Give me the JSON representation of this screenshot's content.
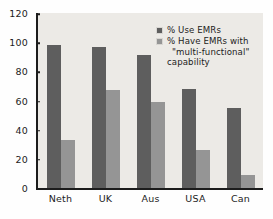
{
  "chart_data": {
    "type": "bar",
    "title": "",
    "subtitle": "",
    "xlabel": "",
    "ylabel": "",
    "categories": [
      "Neth",
      "UK",
      "Aus",
      "USA",
      "Can"
    ],
    "series": [
      {
        "name": "% Use EMRs",
        "color": "#5e5e5e",
        "values": [
          98,
          97,
          91,
          68,
          55
        ]
      },
      {
        "name": "% Have EMRs with \"multi-functional\" capability",
        "color": "#959595",
        "values": [
          33,
          67,
          59,
          26,
          9
        ]
      }
    ],
    "ylim": [
      0,
      120
    ],
    "ytick_step": 20,
    "yticks": [
      0,
      20,
      40,
      60,
      80,
      100,
      120
    ],
    "ytick_labels": [
      "0",
      "20",
      "40",
      "60",
      "80",
      "100",
      "120"
    ],
    "grid": false,
    "legend_position": "top-right",
    "plot_background": "#eceae6",
    "axis_color": "#1c1c1c"
  },
  "legend": {
    "entries": [
      {
        "label": "% Use EMRs",
        "line1": "% Use EMRs",
        "line2": "",
        "line3": ""
      },
      {
        "label": "% Have EMRs with \"multi-functional\" capability",
        "line1": "% Have EMRs with",
        "line2": "\"multi-functional\"",
        "line3": "capability"
      }
    ]
  }
}
